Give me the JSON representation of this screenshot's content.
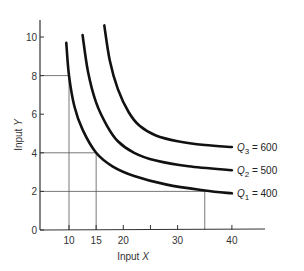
{
  "chart_data": {
    "type": "line",
    "title": "",
    "xlabel": "Input X",
    "ylabel": "Input Y",
    "xlim": [
      4.7,
      46
    ],
    "ylim": [
      0,
      11
    ],
    "grid": false,
    "legend": "inline labels at right end of curves",
    "x_ticks": [
      10,
      15,
      20,
      25,
      30,
      40
    ],
    "x_tick_labels": [
      "10",
      "15",
      "20",
      "",
      "30",
      "40"
    ],
    "y_ticks": [
      0,
      2,
      4,
      6,
      8,
      10
    ],
    "y_tick_labels": [
      "0",
      "2",
      "4",
      "6",
      "8",
      "10"
    ],
    "series": [
      {
        "name": "Q1 = 400",
        "label_main": "Q",
        "label_sub": "1",
        "label_value": " = 400",
        "points": [
          [
            9.5,
            9.7
          ],
          [
            10,
            8
          ],
          [
            11,
            6.4
          ],
          [
            12.5,
            5.2
          ],
          [
            15,
            4
          ],
          [
            18,
            3.3
          ],
          [
            22,
            2.8
          ],
          [
            28,
            2.35
          ],
          [
            35,
            2.05
          ],
          [
            40,
            1.9
          ]
        ]
      },
      {
        "name": "Q2 = 500",
        "label_main": "Q",
        "label_sub": "2",
        "label_value": " = 500",
        "points": [
          [
            12.5,
            10.1
          ],
          [
            13.5,
            8.2
          ],
          [
            15,
            6.6
          ],
          [
            17,
            5.4
          ],
          [
            19,
            4.6
          ],
          [
            22,
            4.0
          ],
          [
            26,
            3.6
          ],
          [
            32,
            3.3
          ],
          [
            40,
            3.1
          ]
        ]
      },
      {
        "name": "Q3 = 600",
        "label_main": "Q",
        "label_sub": "3",
        "label_value": " = 600",
        "points": [
          [
            16.5,
            10.6
          ],
          [
            17.5,
            8.8
          ],
          [
            19,
            7.3
          ],
          [
            21,
            6.1
          ],
          [
            23,
            5.4
          ],
          [
            26,
            4.9
          ],
          [
            30,
            4.6
          ],
          [
            35,
            4.4
          ],
          [
            40,
            4.3
          ]
        ]
      }
    ],
    "reference_lines": [
      {
        "desc": "Q1 point (10,8)",
        "x": 10,
        "y": 8
      },
      {
        "desc": "Q1 point (15,4)",
        "x": 15,
        "y": 4
      },
      {
        "desc": "Q1 point (35,2)",
        "x": 35,
        "y": 2
      }
    ]
  }
}
